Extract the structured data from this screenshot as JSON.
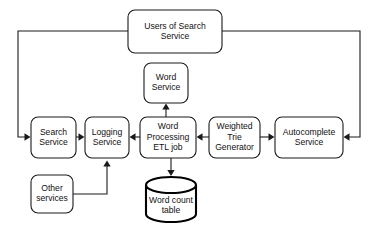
{
  "diagram": {
    "type": "block-flow-diagram",
    "canvas": {
      "width": 375,
      "height": 235,
      "background": "#ffffff"
    },
    "style": {
      "node_fill": "#ffffff",
      "node_stroke": "#1a1a1a",
      "text_color": "#111111",
      "datastore_stroke": "#000000"
    },
    "nodes": [
      {
        "id": "users",
        "shape": "rounded-rect",
        "label": "Users of Search Service",
        "line1": "Users of Search",
        "line2": "Service",
        "line3": "",
        "x": 128,
        "y": 10,
        "w": 94,
        "h": 43
      },
      {
        "id": "word-service",
        "shape": "rounded-rect",
        "label": "Word Service",
        "line1": "Word",
        "line2": "Service",
        "line3": "",
        "x": 144,
        "y": 63,
        "w": 44,
        "h": 40
      },
      {
        "id": "search-service",
        "shape": "rounded-rect",
        "label": "Search Service",
        "line1": "Search",
        "line2": "Service",
        "line3": "",
        "x": 31,
        "y": 117,
        "w": 45,
        "h": 41
      },
      {
        "id": "logging-service",
        "shape": "rounded-rect",
        "label": "Logging Service",
        "line1": "Logging",
        "line2": "Service",
        "line3": "",
        "x": 85,
        "y": 117,
        "w": 44,
        "h": 41
      },
      {
        "id": "word-processing-etl",
        "shape": "rounded-rect",
        "label": "Word Processing ETL job",
        "line1": "Word",
        "line2": "Processing",
        "line3": "ETL job",
        "x": 140,
        "y": 117,
        "w": 56,
        "h": 41
      },
      {
        "id": "weighted-trie-generator",
        "shape": "rounded-rect",
        "label": "Weighted Trie Generator",
        "line1": "Weighted",
        "line2": "Trie",
        "line3": "Generator",
        "x": 209,
        "y": 117,
        "w": 51,
        "h": 41
      },
      {
        "id": "autocomplete-service",
        "shape": "rounded-rect",
        "label": "Autocomplete Service",
        "line1": "Autocomplete",
        "line2": "Service",
        "line3": "",
        "x": 275,
        "y": 117,
        "w": 68,
        "h": 41
      },
      {
        "id": "other-services",
        "shape": "rounded-rect",
        "label": "Other services",
        "line1": "Other",
        "line2": "services",
        "line3": "",
        "x": 31,
        "y": 175,
        "w": 42,
        "h": 38
      },
      {
        "id": "word-count-table",
        "shape": "cylinder",
        "label": "Word count table",
        "line1": "Word count",
        "line2": "table",
        "line3": "",
        "x": 146,
        "y": 177,
        "w": 50,
        "h": 45
      }
    ],
    "edges": [
      {
        "id": "users-to-search",
        "from": "users",
        "to": "search-service",
        "path": "M 128 31 L 18 31 L 18 137 L 28 137",
        "arrow": "right",
        "ax": 30.5,
        "ay": 137
      },
      {
        "id": "users-to-autocomplete",
        "from": "users",
        "to": "autocomplete-service",
        "path": "M 222 31 L 360 31 L 360 137 L 346 137",
        "arrow": "left",
        "ax": 343.5,
        "ay": 137
      },
      {
        "id": "search-to-logging",
        "from": "search-service",
        "to": "logging-service",
        "path": "M 76 137 L 82 137",
        "arrow": "right",
        "ax": 84.5,
        "ay": 137
      },
      {
        "id": "etl-to-logging",
        "from": "word-processing-etl",
        "to": "logging-service",
        "path": "M 140 137 L 132 137",
        "arrow": "left",
        "ax": 129.5,
        "ay": 137
      },
      {
        "id": "trie-to-etl",
        "from": "weighted-trie-generator",
        "to": "word-processing-etl",
        "path": "M 209 137 L 199 137",
        "arrow": "left",
        "ax": 196.5,
        "ay": 137
      },
      {
        "id": "trie-to-autocomplete",
        "from": "weighted-trie-generator",
        "to": "autocomplete-service",
        "path": "M 260 137 L 272 137",
        "arrow": "right",
        "ax": 274.5,
        "ay": 137
      },
      {
        "id": "etl-to-word-service",
        "from": "word-processing-etl",
        "to": "word-service",
        "path": "M 166 117 L 166 106",
        "arrow": "up",
        "ax": 166,
        "ay": 103.5
      },
      {
        "id": "etl-to-word-count-table",
        "from": "word-processing-etl",
        "to": "word-count-table",
        "path": "M 171 158 L 171 172",
        "arrow": "down",
        "ax": 171,
        "ay": 175
      },
      {
        "id": "other-services-to-logging",
        "from": "other-services",
        "to": "logging-service",
        "path": "M 73 194 L 107 194 L 107 164",
        "arrow": "up",
        "ax": 107,
        "ay": 160.5
      }
    ]
  }
}
